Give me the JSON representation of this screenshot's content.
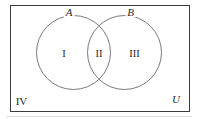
{
  "venn": {
    "type": "venn-diagram",
    "universal_set_label": "U",
    "set_a_label": "A",
    "set_b_label": "B",
    "regions": {
      "a_only": "I",
      "intersection": "II",
      "b_only": "III",
      "outside": "IV"
    },
    "colors": {
      "background": "#ffffff",
      "frame_border": "#3d3d3d",
      "circle_stroke": "#7a7a7a",
      "text": "#2a2a2a",
      "artifact_line": "#dcdcdc"
    }
  }
}
